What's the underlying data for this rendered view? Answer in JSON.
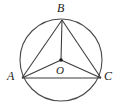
{
  "figure": {
    "background_color": "#ffffff",
    "stroke_color": "#3a3a3a",
    "label_color": "#1a1a1a",
    "labels": {
      "vertex_top": "B",
      "vertex_left": "A",
      "vertex_right": "C",
      "center": "O"
    },
    "geometry": {
      "circle": {
        "cx": 61,
        "cy": 60,
        "r": 41
      },
      "points": {
        "A": {
          "x": 22,
          "y": 78
        },
        "B": {
          "x": 62,
          "y": 20
        },
        "C": {
          "x": 101,
          "y": 78
        },
        "O": {
          "x": 61,
          "y": 60
        }
      },
      "segments": [
        {
          "name": "side-AB",
          "from": "A",
          "to": "B"
        },
        {
          "name": "side-BC",
          "from": "B",
          "to": "C"
        },
        {
          "name": "side-AC",
          "from": "A",
          "to": "C"
        },
        {
          "name": "radius-OA",
          "from": "O",
          "to": "A"
        },
        {
          "name": "radius-OB",
          "from": "O",
          "to": "B"
        },
        {
          "name": "radius-OC",
          "from": "O",
          "to": "C"
        }
      ],
      "center_dot_radius": 1.8
    }
  }
}
